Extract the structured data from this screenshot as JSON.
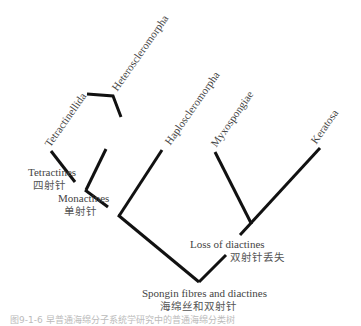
{
  "figure": {
    "type": "phylogenetic-tree",
    "taxa": [
      {
        "id": "tetractinellida",
        "label": "Tetractinellida"
      },
      {
        "id": "heteroscleromorpha",
        "label": "Heteroscleromorpha"
      },
      {
        "id": "haploscleromorpha",
        "label": "Haploscleromorpha"
      },
      {
        "id": "myxospongiae",
        "label": "Myxospongiae"
      },
      {
        "id": "keratosa",
        "label": "Keratosa"
      }
    ],
    "nodes": [
      {
        "id": "tetractines",
        "en": "Tetractines",
        "zh": "四射针"
      },
      {
        "id": "monactines",
        "en": "Monactines",
        "zh": "单射针"
      },
      {
        "id": "loss_of_diactines",
        "en": "Loss of diactines",
        "zh": "双射针丢失"
      },
      {
        "id": "spongin",
        "en": "Spongin fibres and diactines",
        "zh": "海绵丝和双射针"
      }
    ],
    "caption": "图9-1-6  早普通海绵分子系统学研究中的普通海绵分类树",
    "line_color": "#111111"
  }
}
